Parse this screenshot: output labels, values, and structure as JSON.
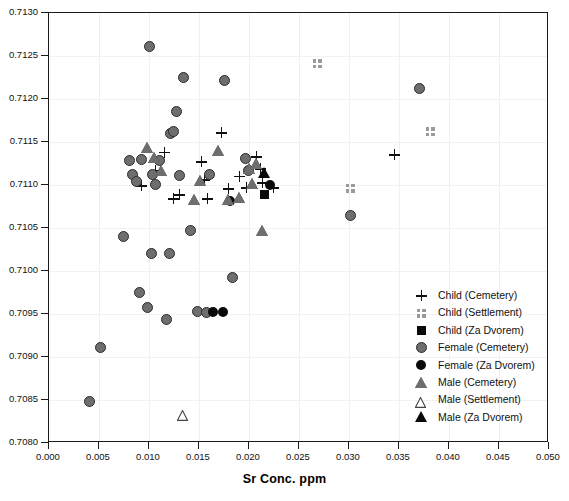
{
  "chart_data": {
    "type": "scatter",
    "title": "",
    "xlabel": "Sr Conc. ppm",
    "ylabel": "",
    "xlim": [
      0.0,
      0.05
    ],
    "ylim": [
      0.708,
      0.713
    ],
    "xticks": [
      "0.000",
      "0.005",
      "0.010",
      "0.015",
      "0.020",
      "0.025",
      "0.030",
      "0.035",
      "0.040",
      "0.045",
      "0.050"
    ],
    "xtick_values": [
      0.0,
      0.005,
      0.01,
      0.015,
      0.02,
      0.025,
      0.03,
      0.035,
      0.04,
      0.045,
      0.05
    ],
    "yticks": [
      "0.7080",
      "0.7085",
      "0.7090",
      "0.7095",
      "0.7100",
      "0.7105",
      "0.7110",
      "0.7115",
      "0.7120",
      "0.7125",
      "0.7130"
    ],
    "ytick_values": [
      0.708,
      0.7085,
      0.709,
      0.7095,
      0.71,
      0.7105,
      0.711,
      0.7115,
      0.712,
      0.7125,
      0.713
    ],
    "grid": true,
    "legend_position": "lower-right",
    "series": [
      {
        "name": "Child (Cemetery)",
        "marker": "plus",
        "color": "#111111",
        "points": [
          [
            0.0092,
            0.71099
          ],
          [
            0.0106,
            0.71117
          ],
          [
            0.0115,
            0.71138
          ],
          [
            0.0124,
            0.71084
          ],
          [
            0.013,
            0.71089
          ],
          [
            0.0152,
            0.71127
          ],
          [
            0.0155,
            0.71106
          ],
          [
            0.0158,
            0.71084
          ],
          [
            0.0172,
            0.71161
          ],
          [
            0.0179,
            0.71096
          ],
          [
            0.019,
            0.7111
          ],
          [
            0.0197,
            0.71097
          ],
          [
            0.0207,
            0.71133
          ],
          [
            0.0211,
            0.71119
          ],
          [
            0.0213,
            0.71103
          ],
          [
            0.0224,
            0.71097
          ],
          [
            0.0345,
            0.71135
          ]
        ]
      },
      {
        "name": "Child (Settlement)",
        "marker": "checkered-square",
        "color": "#9a9a9a",
        "points": [
          [
            0.0268,
            0.71241
          ],
          [
            0.0301,
            0.71096
          ],
          [
            0.0381,
            0.71162
          ]
        ]
      },
      {
        "name": "Child (Za Dvorem)",
        "marker": "filled-square",
        "color": "#0a0a0a",
        "points": [
          [
            0.0215,
            0.71089
          ]
        ]
      },
      {
        "name": "Female (Cemetery)",
        "marker": "filled-circle-gray",
        "color": "#6e6e6e",
        "points": [
          [
            0.004,
            0.70848
          ],
          [
            0.0051,
            0.70911
          ],
          [
            0.0074,
            0.7104
          ],
          [
            0.008,
            0.71128
          ],
          [
            0.0083,
            0.71112
          ],
          [
            0.0087,
            0.71104
          ],
          [
            0.009,
            0.70975
          ],
          [
            0.0092,
            0.7113
          ],
          [
            0.0098,
            0.70958
          ],
          [
            0.01,
            0.71261
          ],
          [
            0.0102,
            0.7102
          ],
          [
            0.0103,
            0.71112
          ],
          [
            0.0106,
            0.71101
          ],
          [
            0.011,
            0.71128
          ],
          [
            0.0117,
            0.70944
          ],
          [
            0.012,
            0.7102
          ],
          [
            0.0121,
            0.7116
          ],
          [
            0.0124,
            0.71162
          ],
          [
            0.0127,
            0.71185
          ],
          [
            0.013,
            0.71111
          ],
          [
            0.0134,
            0.71225
          ],
          [
            0.0141,
            0.71047
          ],
          [
            0.0148,
            0.70953
          ],
          [
            0.0157,
            0.70952
          ],
          [
            0.016,
            0.71112
          ],
          [
            0.0175,
            0.71222
          ],
          [
            0.0183,
            0.70993
          ],
          [
            0.0196,
            0.71131
          ],
          [
            0.0199,
            0.71117
          ],
          [
            0.0301,
            0.71065
          ],
          [
            0.037,
            0.71212
          ]
        ]
      },
      {
        "name": "Female (Za Dvorem)",
        "marker": "filled-circle-black",
        "color": "#0a0a0a",
        "points": [
          [
            0.0164,
            0.70952
          ],
          [
            0.0174,
            0.70952
          ],
          [
            0.0181,
            0.71081
          ],
          [
            0.0221,
            0.711
          ]
        ]
      },
      {
        "name": "Male (Cemetery)",
        "marker": "filled-triangle-gray",
        "color": "#6e6e6e",
        "points": [
          [
            0.0098,
            0.71143
          ],
          [
            0.0105,
            0.71131
          ],
          [
            0.0112,
            0.71116
          ],
          [
            0.0145,
            0.71083
          ],
          [
            0.0151,
            0.71105
          ],
          [
            0.0169,
            0.71139
          ],
          [
            0.0179,
            0.71082
          ],
          [
            0.019,
            0.71085
          ],
          [
            0.02,
            0.71119
          ],
          [
            0.0203,
            0.71101
          ],
          [
            0.0207,
            0.71124
          ],
          [
            0.0213,
            0.71046
          ]
        ]
      },
      {
        "name": "Male (Settlement)",
        "marker": "open-triangle",
        "color": "#555555",
        "points": [
          [
            0.0134,
            0.70835
          ]
        ]
      },
      {
        "name": "Male (Za Dvorem)",
        "marker": "filled-triangle-black",
        "color": "#0a0a0a",
        "points": [
          [
            0.0215,
            0.71114
          ]
        ]
      }
    ]
  },
  "legend": {
    "items": [
      {
        "label": "Child (Cemetery)",
        "marker": "plus"
      },
      {
        "label": "Child (Settlement)",
        "marker": "checkered-square"
      },
      {
        "label": "Child (Za Dvorem)",
        "marker": "filled-square"
      },
      {
        "label": "Female (Cemetery)",
        "marker": "filled-circle-gray"
      },
      {
        "label": "Female (Za Dvorem)",
        "marker": "filled-circle-black"
      },
      {
        "label": "Male (Cemetery)",
        "marker": "filled-triangle-gray"
      },
      {
        "label": "Male (Settlement)",
        "marker": "open-triangle"
      },
      {
        "label": "Male (Za Dvorem)",
        "marker": "filled-triangle-black"
      }
    ]
  },
  "colors": {
    "axis": "#1a1a1a",
    "grid": "#f0f0f0",
    "gray_marker": "#6e6e6e",
    "black_marker": "#0a0a0a",
    "settlement_marker": "#9a9a9a"
  }
}
